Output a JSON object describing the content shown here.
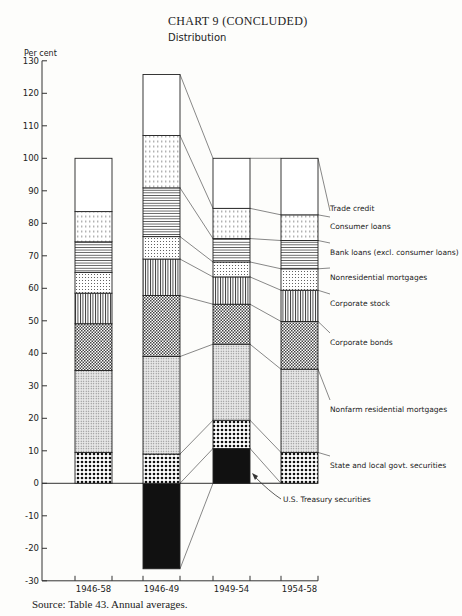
{
  "header": {
    "title": "CHART 9 (CONCLUDED)",
    "subtitle": "Distribution",
    "ylabel": "Per cent"
  },
  "footer": {
    "source": "Source: Table 43. Annual averages."
  },
  "chart_data": {
    "type": "bar",
    "stacked": true,
    "xlabel": "",
    "ylabel": "Per cent",
    "ylim": [
      -30,
      130
    ],
    "yticks": [
      -30,
      -20,
      -10,
      0,
      10,
      20,
      30,
      40,
      50,
      60,
      70,
      80,
      90,
      100,
      110,
      120,
      130
    ],
    "categories": [
      "1946-58",
      "1946-49",
      "1949-54",
      "1954-58"
    ],
    "series": [
      {
        "name": "U.S. Treasury securities",
        "pattern": "solid",
        "values": [
          0.0,
          -26.3,
          10.7,
          0.0
        ]
      },
      {
        "name": "State and local govt. securities",
        "pattern": "dots-large",
        "values": [
          9.5,
          9.0,
          8.7,
          9.5
        ]
      },
      {
        "name": "Nonfarm residential mortgages",
        "pattern": "dots-fine",
        "values": [
          25.2,
          30.0,
          23.4,
          25.6
        ]
      },
      {
        "name": "Corporate bonds",
        "pattern": "checker",
        "values": [
          14.4,
          18.8,
          12.3,
          14.7
        ]
      },
      {
        "name": "Corporate stock",
        "pattern": "vertical",
        "values": [
          9.4,
          11.2,
          8.4,
          9.6
        ]
      },
      {
        "name": "Nonresidential mortgages",
        "pattern": "dots-small",
        "values": [
          6.4,
          6.9,
          4.6,
          6.6
        ]
      },
      {
        "name": "Bank loans (excl. consumer loans)",
        "pattern": "horizontal",
        "values": [
          9.4,
          15.0,
          7.2,
          8.7
        ]
      },
      {
        "name": "Consumer loans",
        "pattern": "dashes",
        "values": [
          9.3,
          16.1,
          9.3,
          7.9
        ]
      },
      {
        "name": "Trade credit",
        "pattern": "blank",
        "values": [
          16.4,
          18.8,
          15.4,
          17.4
        ]
      }
    ],
    "totals": [
      100,
      125.8,
      100,
      100
    ],
    "legend_position": "right (labels aligned to last bar)",
    "grid": false
  }
}
